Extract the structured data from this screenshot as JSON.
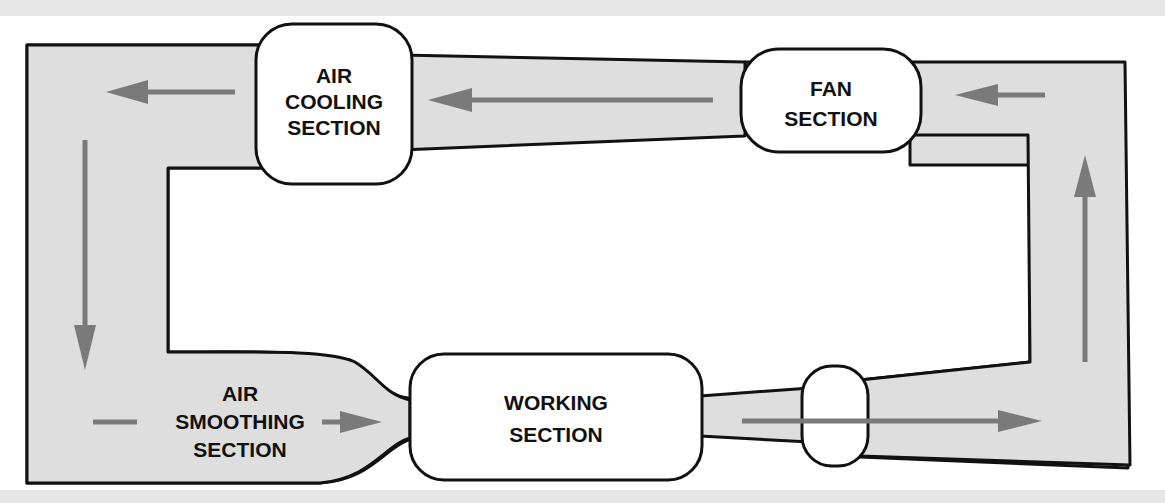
{
  "diagram": {
    "sections": {
      "air_cooling": {
        "lines": [
          "AIR",
          "COOLING",
          "SECTION"
        ]
      },
      "fan": {
        "lines": [
          "FAN",
          "SECTION"
        ]
      },
      "working": {
        "lines": [
          "WORKING",
          "SECTION"
        ]
      },
      "air_smoothing": {
        "lines": [
          "AIR",
          "SMOOTHING",
          "SECTION"
        ]
      }
    },
    "flow_direction": "counter-clockwise",
    "colors": {
      "duct_fill": "#dedede",
      "arrow": "#7a7a7a",
      "outline": "#111111"
    }
  }
}
